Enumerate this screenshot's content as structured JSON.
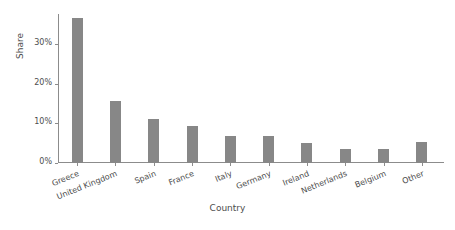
{
  "chart_data": {
    "type": "bar",
    "title": "",
    "xlabel": "Country",
    "ylabel": "Share",
    "categories": [
      "Greece",
      "United Kingdom",
      "Spain",
      "France",
      "Italy",
      "Germany",
      "Ireland",
      "Netherlands",
      "Belgium",
      "Other"
    ],
    "values": [
      36.4,
      15.5,
      11.0,
      9.2,
      6.9,
      6.7,
      5.1,
      3.5,
      3.4,
      5.3
    ],
    "value_unit": "percent",
    "ylim": [
      0,
      37.5
    ],
    "yticks": [
      0,
      10,
      20,
      30
    ],
    "ytick_labels": [
      "0%",
      "10%",
      "20%",
      "30%"
    ],
    "xtick_rotation": -22,
    "grid": false,
    "legend": false,
    "bar_color": "#878787",
    "axis_color": "#8c8c8c",
    "text_color": "#4d4d4d",
    "background_color": "#ffffff"
  }
}
